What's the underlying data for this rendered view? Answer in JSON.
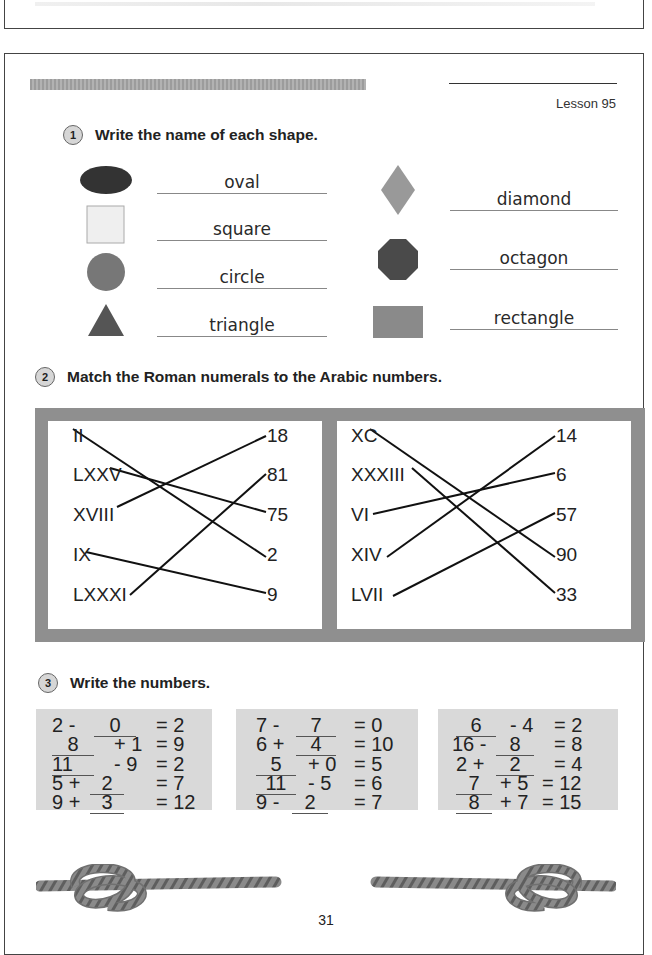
{
  "header": {
    "lesson": "Lesson 95"
  },
  "section1": {
    "number": "1",
    "instruction": "Write the name of each shape.",
    "shapes": [
      {
        "shape": "oval",
        "answer": "oval",
        "color": "#333333"
      },
      {
        "shape": "square",
        "answer": "square",
        "color": "#ededed"
      },
      {
        "shape": "circle",
        "answer": "circle",
        "color": "#777777"
      },
      {
        "shape": "triangle",
        "answer": "triangle",
        "color": "#555555"
      },
      {
        "shape": "diamond",
        "answer": "diamond",
        "color": "#999999"
      },
      {
        "shape": "octagon",
        "answer": "octagon",
        "color": "#4a4a4a"
      },
      {
        "shape": "rectangle",
        "answer": "rectangle",
        "color": "#8a8a8a"
      }
    ]
  },
  "section2": {
    "number": "2",
    "instruction": "Match the Roman numerals to the Arabic numbers.",
    "left_panel": {
      "roman": [
        "II",
        "LXXV",
        "XVIII",
        "IX",
        "LXXXI"
      ],
      "arabic": [
        "18",
        "81",
        "75",
        "2",
        "9"
      ],
      "matches": [
        [
          "II",
          "2"
        ],
        [
          "LXXV",
          "75"
        ],
        [
          "XVIII",
          "18"
        ],
        [
          "IX",
          "9"
        ],
        [
          "LXXXI",
          "81"
        ]
      ]
    },
    "right_panel": {
      "roman": [
        "XC",
        "XXXIII",
        "VI",
        "XIV",
        "LVII"
      ],
      "arabic": [
        "14",
        "6",
        "57",
        "90",
        "33"
      ],
      "matches": [
        [
          "XC",
          "90"
        ],
        [
          "XXXIII",
          "33"
        ],
        [
          "VI",
          "6"
        ],
        [
          "XIV",
          "14"
        ],
        [
          "LVII",
          "57"
        ]
      ]
    }
  },
  "section3": {
    "number": "3",
    "instruction": "Write the numbers.",
    "columns": [
      [
        {
          "a": "2 -",
          "blank": "0",
          "b": "",
          "result": "= 2",
          "blank_pos": "middle"
        },
        {
          "a": "",
          "blank": "8",
          "b": "+ 1",
          "result": "= 9",
          "blank_pos": "first"
        },
        {
          "a": "",
          "blank": "11",
          "b": "- 9",
          "result": "= 2",
          "blank_pos": "first"
        },
        {
          "a": "5 +",
          "blank": "2",
          "b": "",
          "result": "= 7",
          "blank_pos": "middle"
        },
        {
          "a": "9 +",
          "blank": "3",
          "b": "",
          "result": "= 12",
          "blank_pos": "middle"
        }
      ],
      [
        {
          "a": "7 -",
          "blank": "7",
          "b": "",
          "result": "= 0",
          "blank_pos": "middle"
        },
        {
          "a": "6 +",
          "blank": "4",
          "b": "",
          "result": "= 10",
          "blank_pos": "middle"
        },
        {
          "a": "",
          "blank": "5",
          "b": "+ 0",
          "result": "= 5",
          "blank_pos": "first"
        },
        {
          "a": "",
          "blank": "11",
          "b": "- 5",
          "result": "= 6",
          "blank_pos": "first"
        },
        {
          "a": "9 -",
          "blank": "2",
          "b": "",
          "result": "= 7",
          "blank_pos": "middle"
        }
      ],
      [
        {
          "a": "",
          "blank": "6",
          "b": "- 4",
          "result": "= 2",
          "blank_pos": "first"
        },
        {
          "a": "16 -",
          "blank": "8",
          "b": "",
          "result": "= 8",
          "blank_pos": "middle"
        },
        {
          "a": "2 +",
          "blank": "2",
          "b": "",
          "result": "= 4",
          "blank_pos": "middle"
        },
        {
          "a": "",
          "blank": "7",
          "b": "+ 5",
          "result": "= 12",
          "blank_pos": "first"
        },
        {
          "a": "",
          "blank": "8",
          "b": "+ 7",
          "result": "= 15",
          "blank_pos": "first"
        }
      ]
    ]
  },
  "footer": {
    "page_number": "31"
  }
}
